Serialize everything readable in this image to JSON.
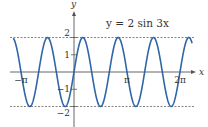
{
  "chart_data": {
    "type": "line",
    "title": "y = 2 sin 3x",
    "function": "2*sin(3*x)",
    "xlabel": "x",
    "ylabel": "y",
    "x_range": [
      -3.6,
      7.0
    ],
    "ylim": [
      -2,
      2
    ],
    "x_ticks": [
      {
        "value": -3.14159,
        "label": "−π"
      },
      {
        "value": 3.14159,
        "label": "π"
      },
      {
        "value": 6.28318,
        "label": "2π"
      }
    ],
    "y_ticks": [
      {
        "value": 2,
        "label": "2"
      },
      {
        "value": 1,
        "label": "1"
      },
      {
        "value": -1,
        "label": "−1"
      },
      {
        "value": -2,
        "label": "−2"
      }
    ],
    "reference_lines": [
      {
        "y": 2,
        "style": "dashed"
      },
      {
        "y": -2,
        "style": "dashed"
      }
    ],
    "grid": false,
    "colors": {
      "curve": "#2f66a8",
      "title": "#3a7fc0",
      "axis": "#555555",
      "dash": "#666666"
    }
  }
}
